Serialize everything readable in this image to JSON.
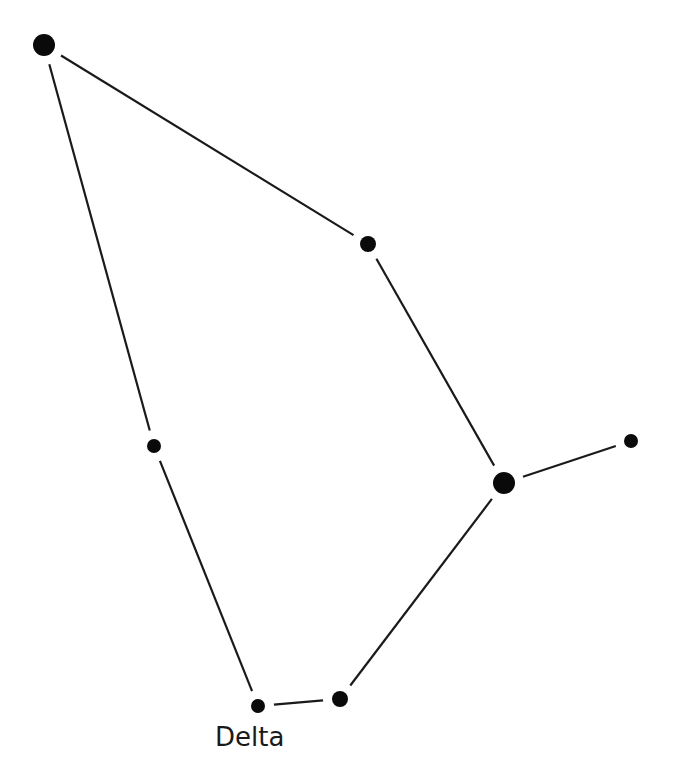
{
  "diagram": {
    "type": "constellation",
    "line_color": "#1a1a1a",
    "star_color": "#0a0a0a",
    "stars": [
      {
        "id": "s1",
        "x": 44,
        "y": 45,
        "r": 11
      },
      {
        "id": "s2",
        "x": 368,
        "y": 244,
        "r": 8
      },
      {
        "id": "s3",
        "x": 154,
        "y": 446,
        "r": 7
      },
      {
        "id": "s4",
        "x": 504,
        "y": 483,
        "r": 11
      },
      {
        "id": "s5",
        "x": 631,
        "y": 441,
        "r": 7
      },
      {
        "id": "s6",
        "x": 340,
        "y": 699,
        "r": 8
      },
      {
        "id": "s7",
        "x": 258,
        "y": 706,
        "r": 7,
        "label": "Delta"
      }
    ],
    "edges": [
      [
        "s1",
        "s2"
      ],
      [
        "s2",
        "s4"
      ],
      [
        "s4",
        "s5"
      ],
      [
        "s4",
        "s6"
      ],
      [
        "s6",
        "s7"
      ],
      [
        "s7",
        "s3"
      ],
      [
        "s3",
        "s1"
      ]
    ],
    "labels": {
      "delta": "Delta"
    }
  }
}
